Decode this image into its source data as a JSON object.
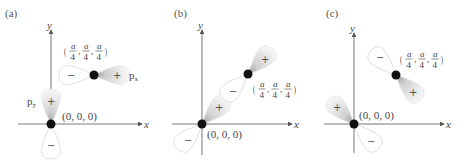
{
  "figure": {
    "colors": {
      "axis": "#555555",
      "atom": "#111111",
      "lobe_outline": "#d8d8d8",
      "lobe_shade": "#bdbdbd",
      "text": "#444444"
    },
    "panels": [
      {
        "id": "a",
        "label": "(a)",
        "x_axis_label": "x",
        "y_axis_label": "y",
        "origin_label": "(0, 0, 0)",
        "second_atom_label": {
          "open": "(",
          "num": "a",
          "den": "4",
          "sep": ",",
          "close": ")"
        },
        "origin_orbital": {
          "name": "py",
          "name_main": "p",
          "name_sub": "y",
          "plus": "+",
          "minus": "−"
        },
        "second_orbital": {
          "name": "px",
          "name_main": "p",
          "name_sub": "x",
          "plus": "+",
          "minus": "−"
        }
      },
      {
        "id": "b",
        "label": "(b)",
        "x_axis_label": "x",
        "y_axis_label": "y",
        "origin_label": "(0, 0, 0)",
        "second_atom_label": {
          "open": "(",
          "num": "a",
          "den": "4",
          "sep": ",",
          "close": ")"
        },
        "origin_orbital": {
          "plus": "+",
          "minus": "−"
        },
        "second_orbital": {
          "plus": "+",
          "minus": "−"
        }
      },
      {
        "id": "c",
        "label": "(c)",
        "x_axis_label": "x",
        "y_axis_label": "y",
        "origin_label": "(0, 0, 0)",
        "second_atom_label": {
          "open": "(",
          "num": "a",
          "den": "4",
          "sep": ",",
          "close": ")"
        },
        "origin_orbital": {
          "plus": "+",
          "minus": "−"
        },
        "second_orbital": {
          "plus": "+",
          "minus": "−"
        }
      }
    ]
  }
}
